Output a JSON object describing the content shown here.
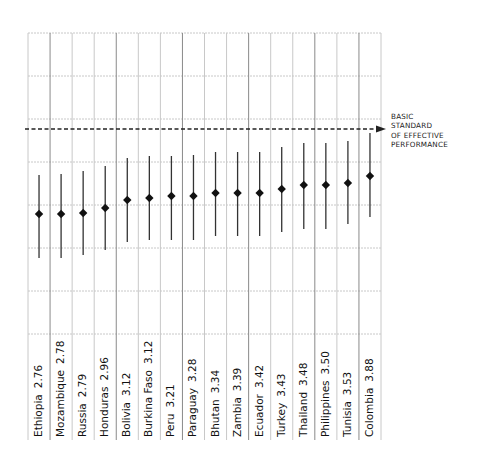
{
  "chart_data": {
    "type": "scatter",
    "subtype": "dot-with-range (diamond point estimate and vertical range bar)",
    "title": "",
    "xlabel": "",
    "ylabel": "",
    "categories": [
      "Ethiopia",
      "Mozambique",
      "Russia",
      "Honduras",
      "Bolivia",
      "Burkina Faso",
      "Peru",
      "Paraguay",
      "Bhutan",
      "Zambia",
      "Ecuador",
      "Turkey",
      "Thailand",
      "Philippines",
      "Tunisia",
      "Colombia"
    ],
    "values": [
      2.76,
      2.78,
      2.79,
      2.96,
      3.12,
      3.12,
      3.21,
      3.28,
      3.34,
      3.39,
      3.42,
      3.43,
      3.48,
      3.5,
      3.53,
      3.88
    ],
    "range_bars_px": {
      "note": "vertical bar extents in image pixel coords (top, bottom)",
      "top": [
        175,
        174,
        171,
        166,
        158,
        156,
        156,
        155,
        152,
        152,
        152,
        147,
        143,
        143,
        141,
        133
      ],
      "bottom": [
        258,
        258,
        255,
        250,
        242,
        240,
        240,
        240,
        236,
        236,
        236,
        232,
        229,
        229,
        224,
        217
      ]
    },
    "point_y_px": [
      214,
      214,
      213,
      208,
      200,
      198,
      196,
      196,
      193,
      193,
      193,
      189,
      185,
      185,
      183,
      176
    ],
    "reference_line": {
      "label_lines": [
        "BASIC",
        "STANDARD",
        "OF EFFECTIVE",
        "PERFORMANCE"
      ],
      "style": "dashed with arrow",
      "y_px": 129
    },
    "grid": {
      "horizontal": true,
      "vertical": true,
      "h_lines_y_px": [
        33,
        76,
        119,
        162,
        205,
        248,
        291,
        334
      ]
    },
    "legend": null,
    "label_format": "{category}  {value}"
  },
  "labels": [
    {
      "name": "Ethiopia",
      "value": "2.76"
    },
    {
      "name": "Mozambique",
      "value": "2.78"
    },
    {
      "name": "Russia",
      "value": "2.79"
    },
    {
      "name": "Honduras",
      "value": "2.96"
    },
    {
      "name": "Bolivia",
      "value": "3.12"
    },
    {
      "name": "Burkina Faso",
      "value": "3.12"
    },
    {
      "name": "Peru",
      "value": "3.21"
    },
    {
      "name": "Paraguay",
      "value": "3.28"
    },
    {
      "name": "Bhutan",
      "value": "3.34"
    },
    {
      "name": "Zambia",
      "value": "3.39"
    },
    {
      "name": "Ecuador",
      "value": "3.42"
    },
    {
      "name": "Turkey",
      "value": "3.43"
    },
    {
      "name": "Thailand",
      "value": "3.48"
    },
    {
      "name": "Philippines",
      "value": "3.50"
    },
    {
      "name": "Tunisia",
      "value": "3.53"
    },
    {
      "name": "Colombia",
      "value": "3.88"
    }
  ],
  "annotation": {
    "line1": "BASIC",
    "line2": "STANDARD",
    "line3": "OF EFFECTIVE",
    "line4": "PERFORMANCE"
  },
  "colors": {
    "grid_light": "#c8c8c8",
    "grid_dark": "#8a8a8a",
    "marker": "#111111",
    "reference_line": "#222222"
  }
}
